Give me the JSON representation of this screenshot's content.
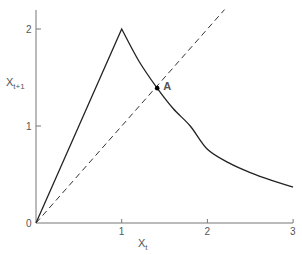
{
  "chart_data": {
    "type": "line",
    "title": "",
    "xlabel": "X_t",
    "ylabel": "X_{t+1}",
    "xlim": [
      0,
      3
    ],
    "ylim": [
      0,
      2.2
    ],
    "grid": false,
    "legend": null,
    "x_ticks": [
      {
        "value": 0,
        "label": "0"
      },
      {
        "value": 1,
        "label": "1"
      },
      {
        "value": 2,
        "label": "2"
      },
      {
        "value": 3,
        "label": "3"
      }
    ],
    "y_ticks": [
      {
        "value": 1,
        "label": "1"
      },
      {
        "value": 2,
        "label": "2"
      }
    ],
    "series": [
      {
        "name": "map",
        "style": "solid",
        "x": [
          0,
          0.5,
          1.0,
          1.2,
          1.414,
          1.6,
          1.8,
          2.0,
          2.25,
          2.5,
          2.75,
          3.0
        ],
        "y": [
          0,
          1.0,
          2.0,
          1.67,
          1.39,
          1.18,
          1.0,
          0.76,
          0.62,
          0.52,
          0.44,
          0.37
        ]
      },
      {
        "name": "identity X_t+1 = X_t",
        "style": "dashed",
        "x": [
          0,
          2.2
        ],
        "y": [
          0,
          2.2
        ]
      }
    ],
    "annotations": [
      {
        "label": "A",
        "x": 1.414,
        "y": 1.39,
        "marker": "dot"
      }
    ]
  },
  "labels": {
    "y_axis": "X",
    "y_axis_sub": "t+1",
    "x_axis": "X",
    "x_axis_sub": "t",
    "origin": "0",
    "point_a": "A"
  }
}
